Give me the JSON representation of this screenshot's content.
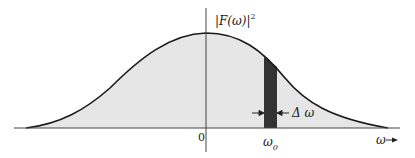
{
  "figure": {
    "type": "power-spectrum-diagram",
    "y_label": "|F(ω)|",
    "y_label_exponent": "2",
    "origin_label": "0",
    "band_center_label": "ω",
    "band_center_subscript": "0",
    "band_width_label": "Δ ω",
    "x_axis_label": "ω",
    "colors": {
      "curve": "#1a1a1a",
      "fill": "#e6e6e6",
      "band": "#333333",
      "axis": "#444444"
    }
  }
}
